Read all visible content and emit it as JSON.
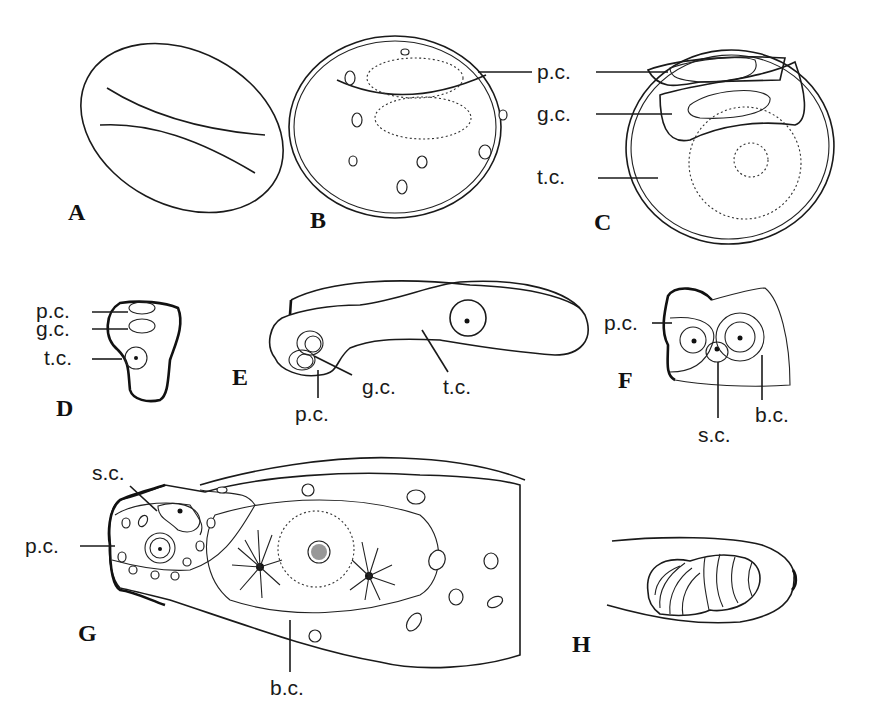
{
  "figure": {
    "panels": [
      {
        "id": "A",
        "label": "A",
        "annotations": []
      },
      {
        "id": "B",
        "label": "B",
        "annotations": [
          "p.c."
        ]
      },
      {
        "id": "C",
        "label": "C",
        "annotations": [
          "p.c.",
          "g.c.",
          "t.c."
        ]
      },
      {
        "id": "D",
        "label": "D",
        "annotations": [
          "p.c.",
          "g.c.",
          "t.c."
        ]
      },
      {
        "id": "E",
        "label": "E",
        "annotations": [
          "g.c.",
          "t.c.",
          "p.c."
        ]
      },
      {
        "id": "F",
        "label": "F",
        "annotations": [
          "p.c.",
          "s.c.",
          "b.c."
        ]
      },
      {
        "id": "G",
        "label": "G",
        "annotations": [
          "s.c.",
          "p.c.",
          "b.c."
        ]
      },
      {
        "id": "H",
        "label": "H",
        "annotations": []
      }
    ],
    "colors": {
      "ink": "#1a1a1a",
      "paper": "#ffffff"
    }
  }
}
